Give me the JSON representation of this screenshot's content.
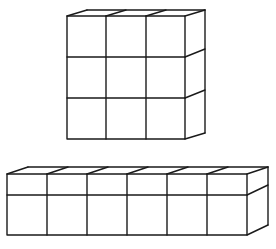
{
  "diagram": {
    "type": "cube-arrangements",
    "shapes": [
      {
        "id": "top-block",
        "description": "3x3x1 arrangement of unit cubes (front face 3 columns by 3 rows, depth 1)",
        "columns": 3,
        "rows": 3,
        "depth": 1,
        "front": {
          "x": 67,
          "y": 16,
          "cell": 39.3
        },
        "offset": {
          "dx": 20,
          "dy": -6
        }
      },
      {
        "id": "bottom-block",
        "description": "6x2x1 arrangement (front face 6 columns, a short top row and a tall bottom row, depth 1)",
        "columns": 6,
        "rows": 2,
        "depth": 1,
        "front": {
          "x": 7,
          "y": 174,
          "cell_w": 40,
          "row_heights": [
            21,
            40
          ]
        },
        "offset": {
          "dx": 21,
          "dy": -7
        }
      }
    ],
    "stroke_color": "#1a1a1a",
    "background": "#ffffff"
  }
}
